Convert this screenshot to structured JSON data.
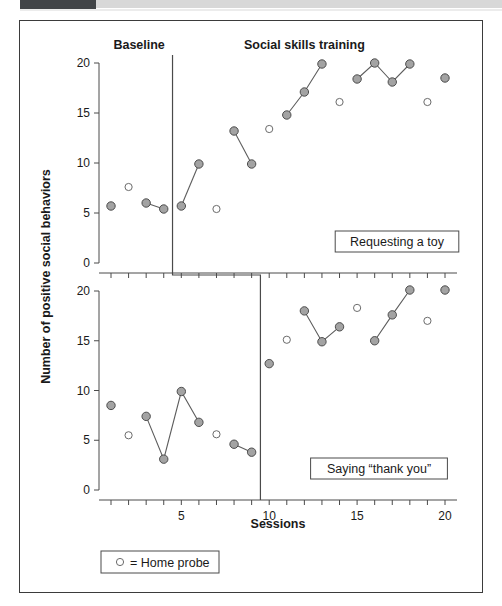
{
  "figure": {
    "axis_title_y": "Number of positive social behaviors",
    "axis_title_x": "Sessions",
    "phase_labels": {
      "baseline": "Baseline",
      "treatment": "Social skills training"
    },
    "panel_labels": {
      "top": "Requesting a toy",
      "bottom": "Saying “thank you”"
    },
    "legend": {
      "text": "○ = Home probe",
      "marker": "open-circle-icon"
    },
    "y_ticks": [
      "0",
      "5",
      "10",
      "15",
      "20"
    ],
    "x_ticks_labeled": [
      "5",
      "10",
      "15",
      "20"
    ]
  },
  "chart_data": {
    "type": "scatter",
    "title": "",
    "subtitle": "",
    "xlabel": "Sessions",
    "ylabel": "Number of positive social behaviors",
    "xlim": [
      0.4,
      20.6
    ],
    "ylim": [
      0,
      20
    ],
    "grid": false,
    "legend_position": "below-plot",
    "design": "multiple-baseline",
    "marker_types": {
      "filled": "Session data (connected)",
      "open": "Home probe"
    },
    "panels": [
      {
        "name": "Requesting a toy",
        "phase_change_x": 4.5,
        "phases": [
          {
            "label": "Baseline",
            "x_range": [
              0.4,
              4.5
            ]
          },
          {
            "label": "Social skills training",
            "x_range": [
              4.5,
              20.6
            ]
          }
        ],
        "series": [
          {
            "name": "Baseline sessions",
            "marker": "filled",
            "connected": true,
            "segments": [
              [
                {
                  "x": 1,
                  "y": 5.7
                }
              ],
              [
                {
                  "x": 3,
                  "y": 6.0
                },
                {
                  "x": 4,
                  "y": 5.4
                }
              ]
            ]
          },
          {
            "name": "Treatment sessions",
            "marker": "filled",
            "connected": true,
            "segments": [
              [
                {
                  "x": 5,
                  "y": 5.7
                },
                {
                  "x": 6,
                  "y": 9.9
                }
              ],
              [
                {
                  "x": 8,
                  "y": 13.2
                },
                {
                  "x": 9,
                  "y": 9.9
                }
              ],
              [
                {
                  "x": 11,
                  "y": 14.8
                },
                {
                  "x": 12,
                  "y": 17.1
                },
                {
                  "x": 13,
                  "y": 19.9
                }
              ],
              [
                {
                  "x": 15,
                  "y": 18.4
                },
                {
                  "x": 16,
                  "y": 20.0
                },
                {
                  "x": 17,
                  "y": 18.1
                },
                {
                  "x": 18,
                  "y": 19.9
                }
              ],
              [
                {
                  "x": 20,
                  "y": 18.5
                }
              ]
            ]
          },
          {
            "name": "Home probe",
            "marker": "open",
            "connected": false,
            "points": [
              {
                "x": 2,
                "y": 7.6
              },
              {
                "x": 7,
                "y": 5.4
              },
              {
                "x": 10,
                "y": 13.4
              },
              {
                "x": 14,
                "y": 16.1
              },
              {
                "x": 19,
                "y": 16.1
              }
            ]
          }
        ]
      },
      {
        "name": "Saying “thank you”",
        "phase_change_x": 9.5,
        "phases": [
          {
            "label": "Baseline",
            "x_range": [
              0.4,
              9.5
            ]
          },
          {
            "label": "Social skills training",
            "x_range": [
              9.5,
              20.6
            ]
          }
        ],
        "series": [
          {
            "name": "Baseline sessions",
            "marker": "filled",
            "connected": true,
            "segments": [
              [
                {
                  "x": 1,
                  "y": 8.5
                }
              ],
              [
                {
                  "x": 3,
                  "y": 7.4
                },
                {
                  "x": 4,
                  "y": 3.1
                },
                {
                  "x": 5,
                  "y": 9.9
                },
                {
                  "x": 6,
                  "y": 6.8
                }
              ],
              [
                {
                  "x": 8,
                  "y": 4.6
                },
                {
                  "x": 9,
                  "y": 3.8
                }
              ]
            ]
          },
          {
            "name": "Treatment sessions",
            "marker": "filled",
            "connected": true,
            "segments": [
              [
                {
                  "x": 10,
                  "y": 12.7
                }
              ],
              [
                {
                  "x": 12,
                  "y": 18.0
                },
                {
                  "x": 13,
                  "y": 14.9
                },
                {
                  "x": 14,
                  "y": 16.4
                }
              ],
              [
                {
                  "x": 16,
                  "y": 15.0
                },
                {
                  "x": 17,
                  "y": 17.6
                },
                {
                  "x": 18,
                  "y": 20.1
                }
              ],
              [
                {
                  "x": 20,
                  "y": 20.1
                }
              ]
            ]
          },
          {
            "name": "Home probe",
            "marker": "open",
            "connected": false,
            "points": [
              {
                "x": 2,
                "y": 5.5
              },
              {
                "x": 7,
                "y": 5.6
              },
              {
                "x": 11,
                "y": 15.1
              },
              {
                "x": 15,
                "y": 18.3
              },
              {
                "x": 19,
                "y": 17.0
              }
            ]
          }
        ]
      }
    ]
  }
}
